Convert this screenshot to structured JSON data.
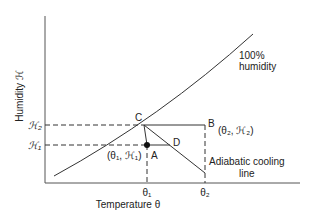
{
  "axes": {
    "y_label": "Humidity ℋ",
    "x_label": "Temperature θ"
  },
  "y_ticks": {
    "h2": "ℋ₂",
    "h1": "ℋ₁"
  },
  "x_ticks": {
    "theta1": "θ₁",
    "theta2": "θ₂"
  },
  "curve_label": {
    "line1": "100%",
    "line2": "humidity"
  },
  "points": {
    "A": {
      "label": "A",
      "coords": "(θ₁, ℋ₁)"
    },
    "B": {
      "label": "B",
      "coords": "(θ₂, ℋ₂)"
    },
    "C": {
      "label": "C"
    },
    "D": {
      "label": "D"
    }
  },
  "adiabatic_label": {
    "line1": "Adiabatic cooling",
    "line2": "line"
  },
  "colors": {
    "line": "#333333",
    "axis": "#555555",
    "point": "#111111"
  }
}
